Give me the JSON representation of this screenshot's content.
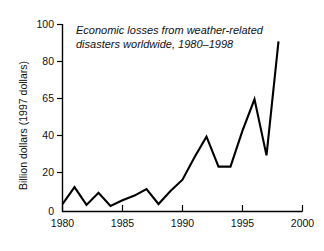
{
  "chart_data": {
    "type": "line",
    "title_line1": "Economic losses from weather-related",
    "title_line2": "disasters worldwide, 1980–1998",
    "xlabel": "",
    "ylabel": "Billion dollars (1997 dollars)",
    "xlim": [
      1980,
      2000
    ],
    "ylim": [
      0,
      100
    ],
    "grid": false,
    "legend": false,
    "line_color": "#000000",
    "xticks": [
      1980,
      1985,
      1990,
      1995,
      2000
    ],
    "xtick_labels": [
      "1980",
      "1985",
      "1990",
      "1995",
      "2000"
    ],
    "yticks": [
      0,
      20,
      40,
      65,
      80,
      100
    ],
    "ytick_labels": [
      "0",
      "20",
      "40",
      "65",
      "80",
      "100"
    ],
    "x": [
      1980,
      1981,
      1982,
      1983,
      1984,
      1985,
      1986,
      1987,
      1988,
      1989,
      1990,
      1991,
      1992,
      1993,
      1994,
      1995,
      1996,
      1997,
      1998
    ],
    "values": [
      4,
      13,
      3.5,
      10,
      3,
      6,
      8.5,
      12,
      4,
      11,
      17,
      29,
      40,
      24,
      24,
      44,
      65,
      30,
      91
    ],
    "series": [
      {
        "name": "Economic losses",
        "values": [
          4,
          13,
          3.5,
          10,
          3,
          6,
          8.5,
          12,
          4,
          11,
          17,
          29,
          40,
          24,
          24,
          44,
          65,
          30,
          91
        ]
      }
    ]
  }
}
